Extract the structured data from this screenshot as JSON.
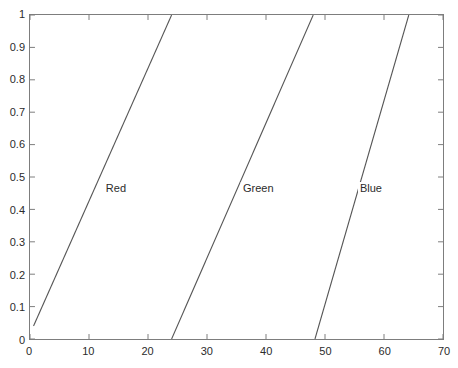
{
  "chart_data": {
    "type": "line",
    "title": "",
    "xlabel": "",
    "ylabel": "",
    "xlim": [
      0,
      70
    ],
    "ylim": [
      0,
      1
    ],
    "xticks": [
      0,
      10,
      20,
      30,
      40,
      50,
      60,
      70
    ],
    "yticks": [
      0,
      0.1,
      0.2,
      0.3,
      0.4,
      0.5,
      0.6,
      0.7,
      0.8,
      0.9,
      1
    ],
    "xtick_labels": [
      "0",
      "10",
      "20",
      "30",
      "40",
      "50",
      "60",
      "70"
    ],
    "ytick_labels": [
      "0",
      "0.1",
      "0.2",
      "0.3",
      "0.4",
      "0.5",
      "0.6",
      "0.7",
      "0.8",
      "0.9",
      "1"
    ],
    "grid": false,
    "legend": "none",
    "line_color": "#555555",
    "axis_color": "#7d7d7d",
    "series": [
      {
        "name": "Red",
        "points": [
          [
            0.6,
            0.04
          ],
          [
            24.0,
            1.0
          ]
        ],
        "label": "Red",
        "label_x": 14.5,
        "label_y": 0.47
      },
      {
        "name": "Green",
        "points": [
          [
            24.0,
            0.0
          ],
          [
            48.0,
            1.0
          ]
        ],
        "label": "Green",
        "label_x": 38.5,
        "label_y": 0.47
      },
      {
        "name": "Blue",
        "points": [
          [
            48.3,
            0.0
          ],
          [
            64.2,
            1.0
          ]
        ],
        "label": "Blue",
        "label_x": 57.5,
        "label_y": 0.47
      }
    ]
  }
}
